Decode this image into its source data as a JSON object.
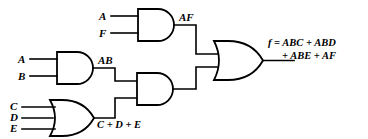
{
  "diagram": {
    "type": "logic-circuit-schematic",
    "line_color": "#000000",
    "background_color": "#ffffff"
  },
  "inputs": {
    "gate_af": [
      {
        "name": "A",
        "label": "A"
      },
      {
        "name": "F",
        "label": "F"
      }
    ],
    "gate_ab": [
      {
        "name": "A",
        "label": "A"
      },
      {
        "name": "B",
        "label": "B"
      }
    ],
    "gate_or_cde": [
      {
        "name": "C",
        "label": "C"
      },
      {
        "name": "D",
        "label": "D"
      },
      {
        "name": "E",
        "label": "E"
      }
    ]
  },
  "gates": [
    {
      "id": "and-af",
      "type": "AND",
      "inputs": [
        "A",
        "F"
      ],
      "output_label": "AF"
    },
    {
      "id": "and-ab",
      "type": "AND",
      "inputs": [
        "A",
        "B"
      ],
      "output_label": "AB"
    },
    {
      "id": "or-cde",
      "type": "OR",
      "inputs": [
        "C",
        "D",
        "E"
      ],
      "output_label": "C + D + E"
    },
    {
      "id": "and-mid",
      "type": "AND",
      "inputs": [
        "AB",
        "C + D + E"
      ],
      "output_label": ""
    },
    {
      "id": "or-final",
      "type": "OR",
      "inputs": [
        "AF",
        "AB(C + D + E)"
      ],
      "output_label": "f = ABC + ABD + ABE + AF"
    }
  ],
  "labels": {
    "af": "AF",
    "ab": "AB",
    "cde": "C + D + E",
    "output_line1": "f = ABC + ABD",
    "output_line2": "+ ABE + AF"
  }
}
